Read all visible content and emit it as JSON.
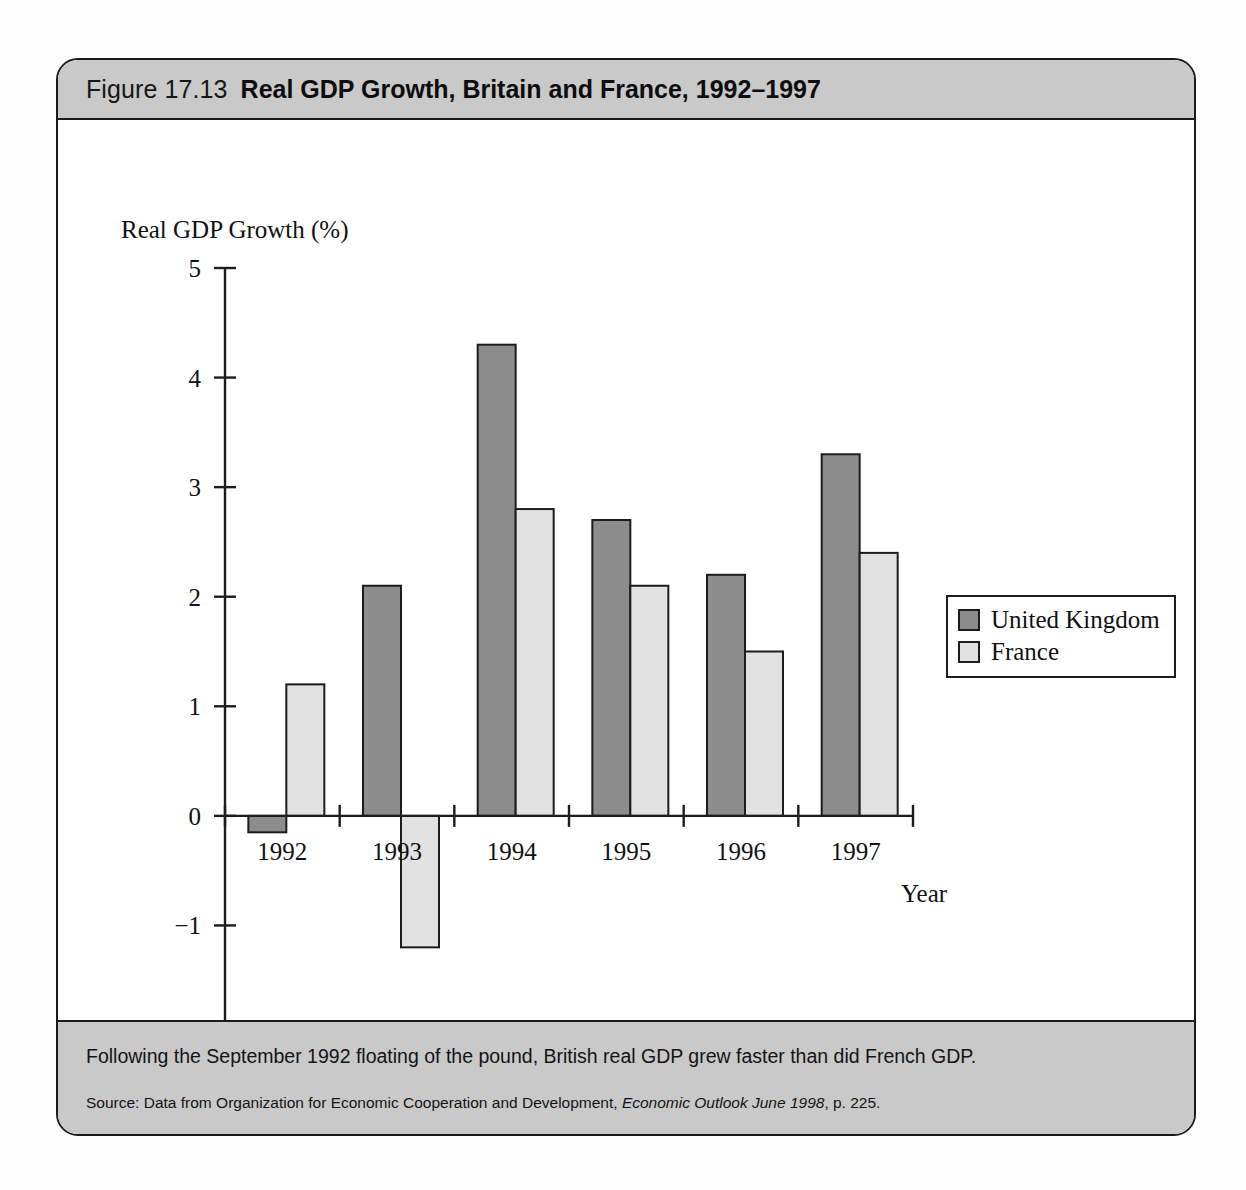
{
  "figure": {
    "number": "Figure 17.13",
    "title": "Real GDP Growth, Britain and France, 1992–1997",
    "caption": "Following the September 1992 floating of the pound, British real GDP grew faster than did French GDP.",
    "source_prefix": "Source: Data from Organization for Economic Cooperation and Development, ",
    "source_italic": "Economic Outlook June 1998",
    "source_suffix": ", p. 225."
  },
  "legend": {
    "position": "right",
    "items": [
      {
        "label": "United Kingdom",
        "color": "#8c8c8c"
      },
      {
        "label": "France",
        "color": "#e2e2e2"
      }
    ]
  },
  "chart_data": {
    "type": "bar",
    "title": "Real GDP Growth, Britain and France, 1992–1997",
    "subtitle": "",
    "xlabel": "Year",
    "ylabel": "Real GDP Growth (%)",
    "categories": [
      "1992",
      "1993",
      "1994",
      "1995",
      "1996",
      "1997"
    ],
    "series": [
      {
        "name": "United Kingdom",
        "color": "#8c8c8c",
        "values": [
          -0.15,
          2.1,
          4.3,
          2.7,
          2.2,
          3.3
        ]
      },
      {
        "name": "France",
        "color": "#e2e2e2",
        "values": [
          1.2,
          -1.2,
          2.8,
          2.1,
          1.5,
          2.4
        ]
      }
    ],
    "ylim": [
      -2,
      5
    ],
    "yticks": [
      5,
      4,
      3,
      2,
      1,
      0,
      -1,
      -2
    ],
    "ytick_labels": [
      "5",
      "4",
      "3",
      "2",
      "1",
      "0",
      "−1",
      "−2"
    ],
    "grid": false,
    "legend_position": "right"
  }
}
